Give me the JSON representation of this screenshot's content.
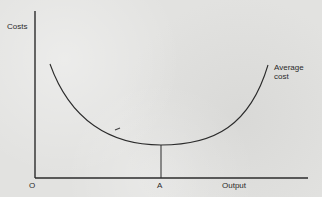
{
  "diagram": {
    "type": "economics-cost-curve",
    "y_axis_label": "Costs",
    "x_axis_label": "Output",
    "origin_label": "O",
    "min_point_label": "A",
    "curve_label_line1": "Average",
    "curve_label_line2": "cost",
    "line_color": "#2b2b2b",
    "background_color": "#e2e2e0"
  }
}
